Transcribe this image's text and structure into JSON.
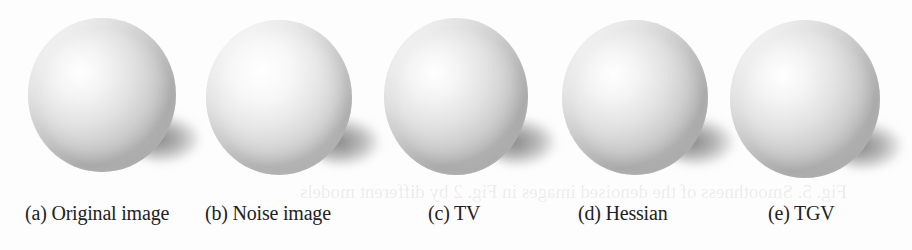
{
  "figure": {
    "panels": [
      {
        "id": "a",
        "caption": "(a) Original image",
        "description": "sphere-original"
      },
      {
        "id": "b",
        "caption": "(b) Noise image",
        "description": "sphere-noisy"
      },
      {
        "id": "c",
        "caption": "(c) TV",
        "description": "sphere-tv-denoised"
      },
      {
        "id": "d",
        "caption": "(d) Hessian",
        "description": "sphere-hessian-denoised"
      },
      {
        "id": "e",
        "caption": "(e) TGV",
        "description": "sphere-tgv-denoised"
      }
    ],
    "bleed_through_text": "Fig. 5. Smoothness of the denoised images in Fig. 2 by different models"
  },
  "colors": {
    "background": "#fdfdfd",
    "caption_text": "#222222",
    "sphere_highlight": "#ffffff",
    "sphere_shade": "#b9b9b9",
    "shadow": "#6e6e6e"
  }
}
